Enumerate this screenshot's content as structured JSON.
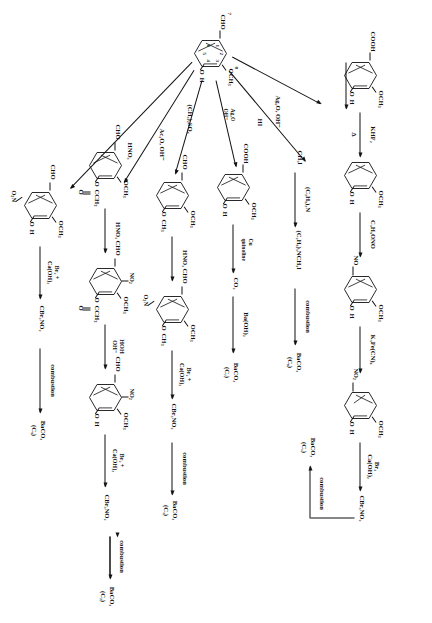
{
  "scheme": {
    "title": "Vanillin degradation / derivatization scheme",
    "orientation": "rotated-90",
    "center_compound": {
      "name": "vanillin",
      "sub_cho": "CHO",
      "sub_och3": "OCH",
      "sub_och3_n": "3",
      "sub_oh_o": "O",
      "sub_oh_h": "H",
      "ring_numbers": [
        "1",
        "2",
        "3",
        "4",
        "5",
        "6"
      ]
    },
    "branches": [
      {
        "id": "ag2o",
        "reagent": "Ag2O, OH-",
        "reagent_display": "Ag₂O, OH⁻",
        "product": "vanillic acid"
      },
      {
        "id": "hi",
        "reagent": "HI",
        "product": "CH3I"
      },
      {
        "id": "ag2o-oh",
        "reagent": "Ag2O OH-",
        "product": "vanillic acid"
      },
      {
        "id": "me2so4",
        "reagent": "(CH3)2SO4",
        "product": "veratraldehyde"
      },
      {
        "id": "ac2o",
        "reagent": "Ac2O, OH-",
        "product": "acetylvanillin"
      },
      {
        "id": "hno3",
        "reagent": "HNO3",
        "product": "nitrovanillin"
      }
    ],
    "labels": {
      "ag2o_oh": "Ag₂O, OH⁻",
      "ac2o_oh": "Ac₂O, OH⁻",
      "khf2": "KHF₂",
      "delta": "Δ",
      "c3h5ono": "C₃H₅ONO",
      "k3fecn6": "K₃Fe(CN)₆",
      "br2": "Br₂",
      "caoh2": "Ca(OH)₂",
      "br2_plus": "Br₂ +",
      "cbr3no2": "CBr₃NO₂",
      "combustion": "combustion",
      "hi": "HI",
      "ch3i": "CH₃I",
      "et3n": "(C₂H₅)₃N",
      "et3nch3i": "(C₂H₅)₃NCH₃I",
      "ag2o_oh2_a": "Ag₂O",
      "ag2o_oh2_b": "OH⁻",
      "cu": "Cu",
      "quinoline": "quinoline",
      "co2": "CO₂",
      "baoh2": "Ba(OH)₂",
      "me2so4": "(CH₃)₂SO₄",
      "hno3": "HNO₃",
      "hoh": "HOH",
      "oh_minus": "OH⁻",
      "cooh": "COOH",
      "och3": "OCH₃",
      "oh_o": "O",
      "oh_h": "H",
      "cho": "CHO",
      "no": "NO",
      "no2_left": "NO₂",
      "no2_down": "O₂N",
      "ch3": "CH₃",
      "ccch3": "CCH₃",
      "o_double": "O",
      "no2_up": "NO₂"
    },
    "products": [
      {
        "formula": "BaCO₃",
        "carbon": "(C₁)"
      },
      {
        "formula": "BaCO₃",
        "carbon": "(C₉)"
      },
      {
        "formula": "BaCO₃",
        "carbon": "(C₇)"
      },
      {
        "formula": "BaCO₃",
        "carbon": "(C₃)"
      },
      {
        "formula": "BaCO₃",
        "carbon": "(C₂)"
      },
      {
        "formula": "BaCO₃",
        "carbon": "(C₅)"
      }
    ],
    "rows": {
      "row1": {
        "start": "vanillic acid",
        "steps": [
          "KHF₂ Δ",
          "C₃H₅ONO",
          "K₃Fe(CN)₆",
          "Br₂ Ca(OH)₂",
          "combustion"
        ],
        "end_a": "CBr₃NO₂",
        "end_b": "BaCO₃ (C₁)"
      },
      "row2": {
        "start": "CH₃I",
        "steps": [
          "(C₂H₅)₃N",
          "combustion"
        ],
        "mid": "(C₂H₅)₃NCH₃I",
        "end": "BaCO₃ (C₉)"
      },
      "row3": {
        "start": "vanillic acid",
        "steps": [
          "Cu quinoline",
          "Ba(OH)₂"
        ],
        "mid": "CO₂",
        "end": "BaCO₃ (C₇)"
      },
      "row4": {
        "start": "veratraldehyde",
        "steps": [
          "HNO₃",
          "Br₂ + Ca(OH)₂",
          "combustion"
        ],
        "mid": "CBr₃NO₂",
        "end": "BaCO₃ (C₃)"
      },
      "row5": {
        "start": "acetylvanillin",
        "steps": [
          "HNO₃",
          "HOH OH⁻",
          "Br₂ + Ca(OH)₂",
          "combustion"
        ],
        "mid": "CBr₃NO₂",
        "end": "BaCO₃ (C₂)"
      },
      "row6": {
        "start": "nitrovanillin",
        "steps": [
          "Br₂ + Ca(OH)₂",
          "combustion"
        ],
        "mid": "CBr₃NO₂",
        "end": "BaCO₃ (C₅)"
      }
    }
  }
}
